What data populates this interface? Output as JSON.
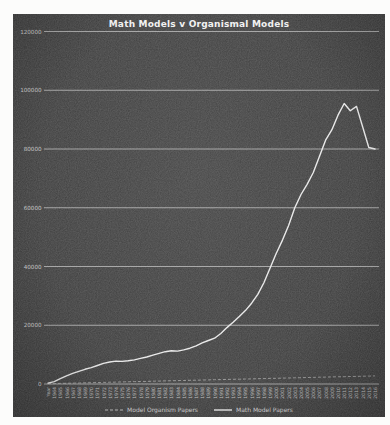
{
  "chart_data": {
    "type": "line",
    "title": "Math Models v Organismal Models",
    "xlabel": "",
    "ylabel": "",
    "ylim": [
      0,
      120000
    ],
    "yticks": [
      0,
      20000,
      40000,
      60000,
      80000,
      100000,
      120000
    ],
    "grid": "horizontal",
    "legend_position": "bottom",
    "categories": [
      "Year",
      "1964",
      "1965",
      "1966",
      "1967",
      "1968",
      "1969",
      "1970",
      "1971",
      "1972",
      "1973",
      "1974",
      "1975",
      "1976",
      "1977",
      "1978",
      "1979",
      "1980",
      "1981",
      "1982",
      "1983",
      "1984",
      "1985",
      "1986",
      "1987",
      "1988",
      "1989",
      "1990",
      "1991",
      "1992",
      "1993",
      "1994",
      "1995",
      "1996",
      "1997",
      "1998",
      "1999",
      "2000",
      "2001",
      "2002",
      "2003",
      "2004",
      "2005",
      "2006",
      "2007",
      "2008",
      "2009",
      "2010",
      "2011",
      "2012",
      "2013",
      "2014",
      "2015",
      "2016"
    ],
    "series": [
      {
        "name": "Model Organism Papers",
        "style": "dashed",
        "color": "#b5b5b5",
        "values": [
          100,
          150,
          200,
          250,
          300,
          350,
          400,
          450,
          500,
          550,
          600,
          650,
          700,
          750,
          800,
          850,
          900,
          950,
          1000,
          1050,
          1100,
          1150,
          1200,
          1250,
          1300,
          1350,
          1400,
          1450,
          1500,
          1550,
          1600,
          1650,
          1700,
          1750,
          1800,
          1850,
          1900,
          1950,
          2000,
          2050,
          2100,
          2150,
          2200,
          2250,
          2300,
          2350,
          2400,
          2450,
          2500,
          2550,
          2600,
          2650,
          2700,
          2750
        ]
      },
      {
        "name": "Math Model Papers",
        "style": "solid",
        "color": "#ececec",
        "values": [
          300,
          800,
          1800,
          2800,
          3600,
          4300,
          5000,
          5600,
          6300,
          7000,
          7500,
          7800,
          7700,
          7900,
          8200,
          8700,
          9200,
          9800,
          10400,
          11000,
          11300,
          11200,
          11600,
          12200,
          13000,
          14000,
          14800,
          15600,
          17200,
          19200,
          21000,
          23000,
          25000,
          27500,
          30500,
          34500,
          39500,
          44500,
          49000,
          54000,
          60000,
          64500,
          68000,
          72000,
          77500,
          83000,
          86500,
          91500,
          95500,
          93000,
          94500,
          87500,
          80500,
          80000
        ]
      }
    ],
    "colors": {
      "panel_background": "#3d3d3d",
      "gridline": "#e8e8e8",
      "title_text": "#f2f2f2",
      "axis_text": "#c2c2c2",
      "page_background": "#fcfcfb"
    }
  }
}
